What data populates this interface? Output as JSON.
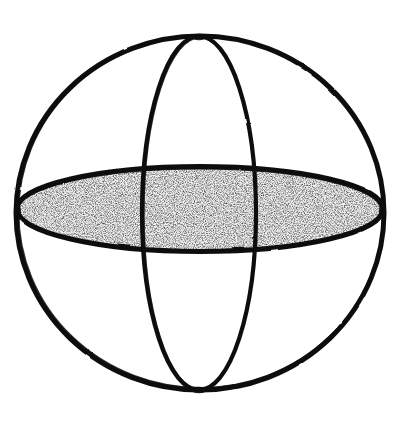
{
  "figure": {
    "title": "Sphere with equatorial disc and meridian circle",
    "medium": "hand-drawn ink line drawing",
    "background_color": "#ffffff",
    "ink_color": "#0d0d0d",
    "fill_color": "#e8e8e8",
    "canvas": {
      "width": 398,
      "height": 433
    }
  },
  "chart_data": {
    "type": "diagram",
    "title": "Sphere with equatorial disc and meridian circle",
    "xlabel": "",
    "ylabel": "",
    "grid": false,
    "legend": "none",
    "xlim": [
      0,
      398
    ],
    "ylim": [
      0,
      433
    ],
    "shapes": [
      {
        "name": "outer-sphere-outline",
        "kind": "ellipse",
        "cx": 200,
        "cy": 213,
        "rx": 184,
        "ry": 177,
        "stroke": "#0d0d0d",
        "stroke_width": 5,
        "fill": "none",
        "description": "Great circle silhouette of the sphere"
      },
      {
        "name": "equatorial-disc",
        "kind": "ellipse",
        "cx": 200,
        "cy": 209,
        "rx": 184,
        "ry": 43,
        "stroke": "#0d0d0d",
        "stroke_width": 5,
        "fill": "#e8e8e8",
        "description": "Horizontal equator drawn in perspective, shaded with stipple texture"
      },
      {
        "name": "meridian-circle",
        "kind": "ellipse",
        "cx": 199,
        "cy": 213,
        "rx": 57,
        "ry": 177,
        "stroke": "#0d0d0d",
        "stroke_width": 4,
        "fill": "none",
        "description": "Vertical meridian drawn in perspective, narrow ellipse"
      }
    ],
    "intersections": [
      {
        "name": "north-pole",
        "x": 199,
        "y": 37
      },
      {
        "name": "south-pole",
        "x": 199,
        "y": 390
      },
      {
        "name": "equator-left",
        "x": 16,
        "y": 211
      },
      {
        "name": "equator-right",
        "x": 384,
        "y": 211
      },
      {
        "name": "meridian-equator-left",
        "x": 142,
        "y": 209
      },
      {
        "name": "meridian-equator-right",
        "x": 256,
        "y": 209
      }
    ]
  }
}
